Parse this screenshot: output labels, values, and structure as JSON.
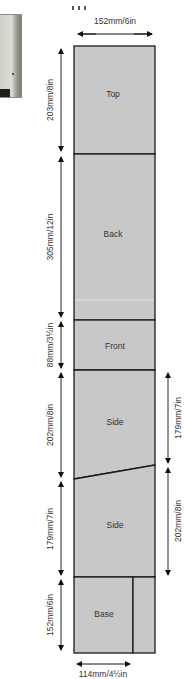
{
  "diagram": {
    "type": "cutting-plan",
    "board": {
      "width_label": "152mm/6in",
      "fill_color": "#c8c8c8",
      "line_color": "#1a1a1a"
    },
    "panels": [
      {
        "name": "Top",
        "label": "Top"
      },
      {
        "name": "Back",
        "label": "Back"
      },
      {
        "name": "Front",
        "label": "Front"
      },
      {
        "name": "Side-1",
        "label": "Side"
      },
      {
        "name": "Side-2",
        "label": "Side"
      },
      {
        "name": "Base",
        "label": "Base"
      }
    ],
    "left_dimensions": [
      {
        "panel": "Top",
        "label": "203mm/8in"
      },
      {
        "panel": "Back",
        "label": "305mm/12in"
      },
      {
        "panel": "Front",
        "label": "88mm/3½in"
      },
      {
        "panel": "Side-1",
        "label": "202mm/8in"
      },
      {
        "panel": "Side-2",
        "label": "179mm/7in"
      },
      {
        "panel": "Base",
        "label": "152mm/6in"
      }
    ],
    "right_dimensions": [
      {
        "panel": "Side-1",
        "label": "179mm/7in"
      },
      {
        "panel": "Side-2",
        "label": "202mm/8in"
      }
    ],
    "bottom_dimension": {
      "label": "114mm/4½in"
    },
    "top_dimension": {
      "label": "152mm/6in"
    }
  }
}
